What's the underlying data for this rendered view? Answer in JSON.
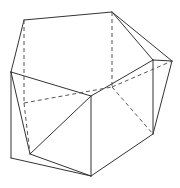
{
  "diagram": {
    "title": "",
    "colors": {
      "background": "#ffffff",
      "solid_edge": "#333333",
      "hidden_edge": "#555555"
    },
    "vertices": {
      "A": [
        24,
        20
      ],
      "B": [
        112,
        12
      ],
      "L": [
        11,
        72
      ],
      "F": [
        91,
        96
      ],
      "S": [
        153,
        60
      ],
      "R": [
        172,
        61
      ],
      "Bl": [
        11,
        158
      ],
      "Bi": [
        30,
        154
      ],
      "Bf": [
        91,
        176
      ],
      "Br": [
        153,
        134
      ],
      "H1": [
        24,
        103
      ],
      "H2": [
        112,
        87
      ]
    },
    "solid_edges": [
      [
        "A",
        "B"
      ],
      [
        "A",
        "L"
      ],
      [
        "B",
        "S"
      ],
      [
        "B",
        "R"
      ],
      [
        "S",
        "R"
      ],
      [
        "L",
        "F"
      ],
      [
        "F",
        "S"
      ],
      [
        "L",
        "Bl"
      ],
      [
        "L",
        "Bi"
      ],
      [
        "Bi",
        "F"
      ],
      [
        "F",
        "Bf"
      ],
      [
        "Bi",
        "Bf"
      ],
      [
        "Bl",
        "Bf"
      ],
      [
        "S",
        "Br"
      ],
      [
        "R",
        "Br"
      ],
      [
        "Bf",
        "Br"
      ]
    ],
    "dashed_edges": [
      [
        "A",
        "H1"
      ],
      [
        "B",
        "H2"
      ],
      [
        "H1",
        "H2"
      ],
      [
        "H2",
        "R"
      ],
      [
        "H2",
        "Br"
      ],
      [
        "H1",
        "Bi"
      ]
    ]
  }
}
